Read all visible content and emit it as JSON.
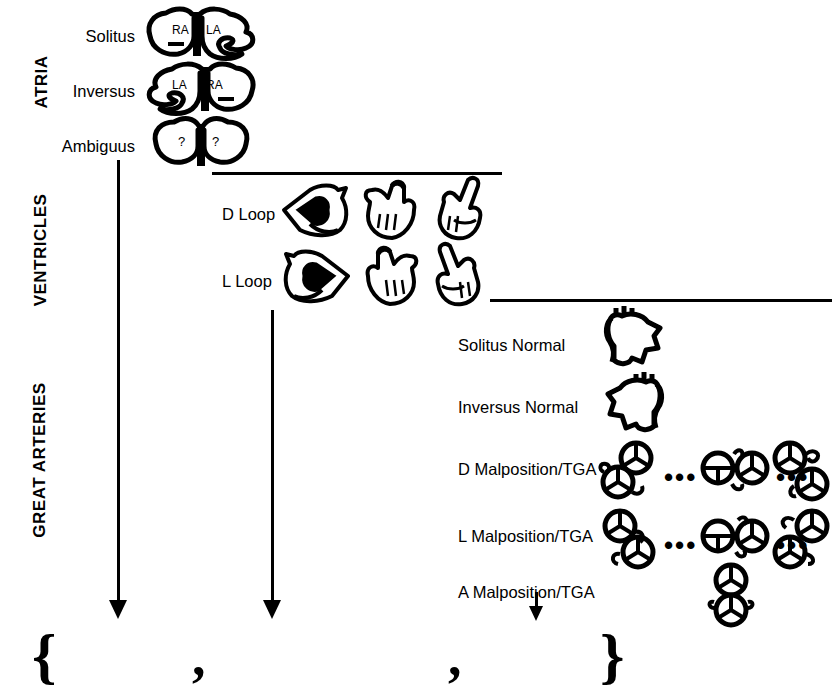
{
  "figure": {
    "ink_color": "#000000",
    "background_color": "#ffffff"
  },
  "sections": [
    {
      "id": "atria",
      "title": "ATRIA",
      "rows": [
        {
          "label": "Solitus",
          "chambers_left": "RA",
          "chambers_right": "LA"
        },
        {
          "label": "Inversus",
          "chambers_left": "LA",
          "chambers_right": "RA"
        },
        {
          "label": "Ambiguus",
          "chambers_left": "?",
          "chambers_right": "?"
        }
      ]
    },
    {
      "id": "ventricles",
      "title": "VENTRICLES",
      "rows": [
        {
          "label": "D Loop"
        },
        {
          "label": "L Loop"
        }
      ]
    },
    {
      "id": "great-arteries",
      "title": "GREAT ARTERIES",
      "rows": [
        {
          "label": "Solitus Normal"
        },
        {
          "label": "Inversus Normal"
        },
        {
          "label": "D Malposition/TGA"
        },
        {
          "label": "L Malposition/TGA"
        },
        {
          "label": "A Malposition/TGA"
        }
      ]
    }
  ],
  "separators": {
    "ellipsis": "•••"
  },
  "notation": {
    "open_brace": "{",
    "comma_first": ",",
    "comma_second": ",",
    "close_brace": "}"
  }
}
